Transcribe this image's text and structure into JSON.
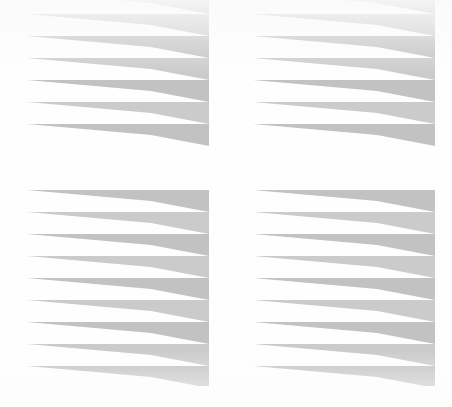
{
  "document": {
    "kind": "scanned-page",
    "width": 452,
    "height": 407,
    "background_color": "#ffffff",
    "caption": "Scanned page showing four blocks of horizontal gray bars with wedge-shaped right ends"
  },
  "palette": {
    "bar_gray": "#c2c2c2",
    "bar_gray_light": "#cbcbcb",
    "paper_white": "#ffffff",
    "page_tint": "#fdfdfd"
  },
  "geometry": {
    "bar_pitch": 22,
    "bar_thickness": 11,
    "wedge_start_x_offset": 124,
    "right_edge_x_offset": 182
  },
  "blocks": [
    {
      "id": "block-top-left",
      "label": "Top left striped block",
      "x": 27,
      "y": -8,
      "width": 182,
      "height": 174,
      "bar_count": 7,
      "first_bar_clipped": true
    },
    {
      "id": "block-top-right",
      "label": "Top right striped block",
      "x": 253,
      "y": -8,
      "width": 182,
      "height": 174,
      "bar_count": 7,
      "first_bar_clipped": true
    },
    {
      "id": "block-bottom-left",
      "label": "Bottom left striped block",
      "x": 27,
      "y": 190,
      "width": 182,
      "height": 196,
      "bar_count": 9,
      "first_bar_clipped": false
    },
    {
      "id": "block-bottom-right",
      "label": "Bottom right striped block",
      "x": 253,
      "y": 190,
      "width": 182,
      "height": 196,
      "bar_count": 9,
      "first_bar_clipped": false
    }
  ]
}
